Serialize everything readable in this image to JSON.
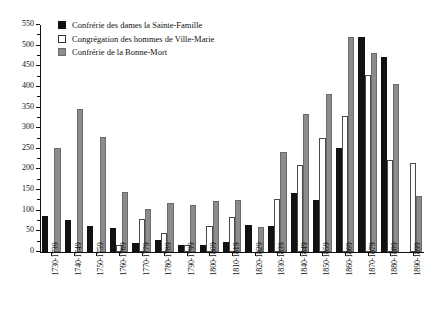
{
  "chart_data": {
    "type": "bar",
    "title": "",
    "xlabel": "",
    "ylabel": "",
    "ylim": [
      0,
      550
    ],
    "ytick_step": 50,
    "yticks": [
      0,
      50,
      100,
      150,
      200,
      250,
      300,
      350,
      400,
      450,
      500,
      550
    ],
    "grid": false,
    "legend_position": "top-left",
    "categories": [
      "1730-1739",
      "1740-1749",
      "1750-1759",
      "1760-1769",
      "1770-1779",
      "1780-1789",
      "1790-1799",
      "1800-1809",
      "1810-1819",
      "1820-1829",
      "1830-1839",
      "1840-1849",
      "1850-1859",
      "1860-1869",
      "1870-1879",
      "1880-1889",
      "1890-1899"
    ],
    "series": [
      {
        "name": "Confrérie des dames la Sainte-Famille",
        "color": "#111111",
        "values": [
          88,
          78,
          62,
          59,
          22,
          28,
          16,
          17,
          24,
          66,
          64,
          144,
          125,
          251,
          521,
          473,
          null
        ]
      },
      {
        "name": "Congrégation des hommes de Ville-Marie",
        "color": "#ffffff",
        "values": [
          null,
          null,
          null,
          17,
          81,
          46,
          16,
          64,
          84,
          null,
          128,
          210,
          276,
          330,
          428,
          223,
          216
        ]
      },
      {
        "name": "Confrérie de la Bonne-Mort",
        "color": "#8c8c8c",
        "values": [
          253,
          346,
          278,
          145,
          104,
          119,
          114,
          124,
          126,
          60,
          243,
          335,
          383,
          521,
          481,
          408,
          136
        ]
      }
    ]
  },
  "legend": {
    "items": [
      {
        "label": "Confrérie des dames la Sainte-Famille",
        "swatch": "black-filled-square"
      },
      {
        "label": "Congrégation des hommes de Ville-Marie",
        "swatch": "white-outlined-square"
      },
      {
        "label": "Confrérie de la Bonne-Mort",
        "swatch": "gray-filled-square"
      }
    ]
  }
}
